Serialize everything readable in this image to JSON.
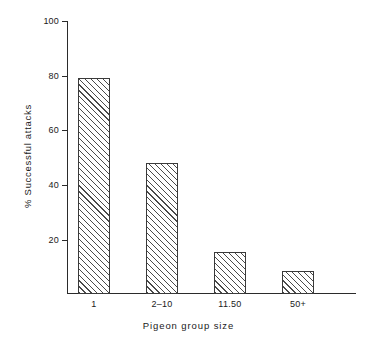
{
  "chart_data": {
    "type": "bar",
    "title": "",
    "subtitle": "",
    "xlabel": "Pigeon group size",
    "ylabel": "% Successful attacks",
    "categories": [
      "1",
      "2–10",
      "11.50",
      "50+"
    ],
    "values": [
      79,
      48,
      15.5,
      8.5
    ],
    "series": [
      {
        "name": "% Successful attacks",
        "values": [
          79,
          48,
          15.5,
          8.5
        ]
      }
    ],
    "ylim": [
      0,
      100
    ],
    "yticks": [
      100,
      80,
      60,
      40,
      20
    ],
    "ytick_labels": [
      "100",
      "80",
      "60",
      "40",
      "20"
    ],
    "grid": false,
    "legend": false,
    "legend_position": "none",
    "bar_fill": "diagonal-hatch",
    "bar_edge_color": "#3a3a3a",
    "background_color": "#ffffff",
    "axis_color": "#2b2b2b"
  },
  "figure": {
    "x_axis_title": "Pigeon group size",
    "y_axis_title": "% Successful attacks"
  }
}
